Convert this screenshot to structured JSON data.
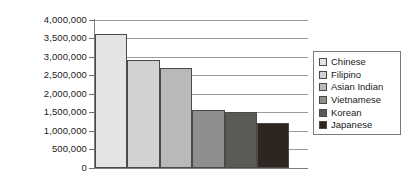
{
  "chart_data": {
    "type": "bar",
    "title": "",
    "subtitle": "",
    "xlabel": "",
    "ylabel": "",
    "categories": [
      "Chinese",
      "Filipino",
      "Asian Indian",
      "Vietnamese",
      "Korean",
      "Japanese"
    ],
    "values": [
      3600000,
      2900000,
      2700000,
      1570000,
      1520000,
      1220000
    ],
    "ylim": [
      0,
      4000000
    ],
    "ytick_labels": [
      "4,000,000",
      "3,500,000",
      "3,000,000",
      "2,500,000",
      "2,000,000",
      "1,500,000",
      "1,000,000",
      "500,000",
      "0"
    ],
    "ytick_values": [
      4000000,
      3500000,
      3000000,
      2500000,
      2000000,
      1500000,
      1000000,
      500000,
      0
    ],
    "xtick_labels": [],
    "grid": true,
    "grid_axis": "y",
    "legend_position": "right",
    "bar_colors": [
      "#e4e4e2",
      "#d2d2d0",
      "#b9b9b7",
      "#8e8e8c",
      "#5c5a57",
      "#2e2420"
    ],
    "bar_edge_color": "#4a4a4a",
    "axis_color": "#7d7d7d",
    "grid_color": "#9a9a9a",
    "text_color": "#1b1b1b",
    "background": "#ffffff"
  },
  "legend": {
    "items": [
      {
        "label": "Chinese",
        "color": "#e4e4e2"
      },
      {
        "label": "Filipino",
        "color": "#d2d2d0"
      },
      {
        "label": "Asian Indian",
        "color": "#b9b9b7"
      },
      {
        "label": "Vietnamese",
        "color": "#8e8e8c"
      },
      {
        "label": "Korean",
        "color": "#5c5a57"
      },
      {
        "label": "Japanese",
        "color": "#2e2420"
      }
    ]
  }
}
